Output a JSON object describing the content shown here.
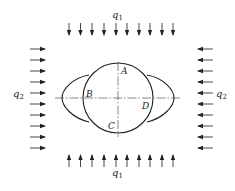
{
  "diagram": {
    "title": "",
    "loads": {
      "vertical": {
        "symbol": "q",
        "subscript": "1",
        "count_top": 10,
        "count_bottom": 10
      },
      "horizontal": {
        "symbol": "q",
        "subscript": "2",
        "count_left": 10,
        "count_right": 10
      }
    },
    "points": [
      {
        "label": "A",
        "x": 121,
        "y": 74
      },
      {
        "label": "B",
        "x": 86,
        "y": 97
      },
      {
        "label": "C",
        "x": 108,
        "y": 129
      },
      {
        "label": "D",
        "x": 142,
        "y": 109
      }
    ],
    "circle": {
      "cx": 118,
      "cy": 98,
      "r": 35
    },
    "colors": {
      "line": "#222222",
      "axis": "#555555",
      "background": "#ffffff"
    }
  }
}
